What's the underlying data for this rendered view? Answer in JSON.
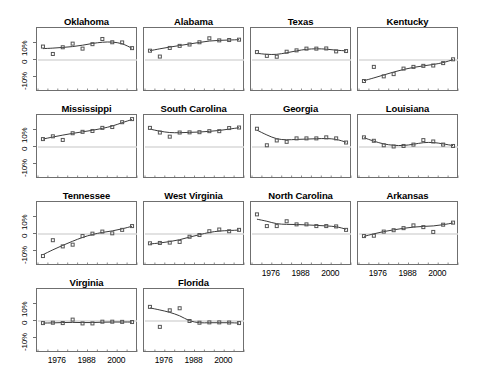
{
  "figure": {
    "type": "small-multiples-scatter-with-smooth",
    "background": "#ffffff",
    "axis_color": "#6f6f6f",
    "zero_line_color": "#d9d9d9",
    "point_color": "#555555",
    "line_color": "#3a3a3a"
  },
  "axes": {
    "y_ticks": [
      "10%",
      "0",
      "-10%"
    ],
    "y_values": [
      10,
      0,
      -10
    ],
    "y_range": [
      -18,
      18
    ],
    "x_ticks": [
      "1976",
      "1988",
      "2000"
    ],
    "x_tick_values": [
      1976,
      1988,
      2000
    ],
    "x_range": [
      1968,
      2008
    ],
    "n_minor_ticks": 11
  },
  "chart_data": {
    "type": "line",
    "title": "",
    "xlabel": "",
    "ylabel": "",
    "ylim": [
      -18,
      18
    ],
    "xlim": [
      1968,
      2008
    ],
    "panels": [
      {
        "name": "Oklahoma",
        "row": 0,
        "col": 0,
        "x": [
          1970,
          1974,
          1978,
          1982,
          1986,
          1990,
          1994,
          1998,
          2002,
          2006
        ],
        "points": [
          7.8,
          3.5,
          7.4,
          9.5,
          6.6,
          9.2,
          12.2,
          10.3,
          10.2,
          6.9
        ],
        "smooth": [
          6.6,
          6.9,
          7.3,
          7.8,
          8.6,
          9.6,
          10.3,
          10.4,
          9.4,
          6.8
        ]
      },
      {
        "name": "Alabama",
        "row": 0,
        "col": 1,
        "x": [
          1970,
          1974,
          1978,
          1982,
          1986,
          1990,
          1994,
          1998,
          2002,
          2006
        ],
        "points": [
          5.4,
          2.0,
          7.0,
          8.2,
          9.0,
          10.3,
          12.6,
          11.4,
          11.6,
          11.8
        ],
        "smooth": [
          5.4,
          6.5,
          7.5,
          8.4,
          9.3,
          10.2,
          11.0,
          11.4,
          11.6,
          11.8
        ]
      },
      {
        "name": "Texas",
        "row": 0,
        "col": 2,
        "x": [
          1970,
          1974,
          1978,
          1982,
          1986,
          1990,
          1994,
          1998,
          2002,
          2006
        ],
        "points": [
          4.6,
          2.4,
          1.9,
          4.8,
          5.6,
          6.6,
          6.6,
          6.7,
          5.0,
          5.2
        ],
        "smooth": [
          3.9,
          3.3,
          3.3,
          4.2,
          5.3,
          6.2,
          6.5,
          6.3,
          5.7,
          5.3
        ]
      },
      {
        "name": "Kentucky",
        "row": 0,
        "col": 3,
        "x": [
          1970,
          1974,
          1978,
          1982,
          1986,
          1990,
          1994,
          1998,
          2002,
          2006
        ],
        "points": [
          -12.2,
          -4.0,
          -9.5,
          -8.2,
          -5.0,
          -4.0,
          -3.4,
          -3.2,
          -1.8,
          0.4
        ],
        "smooth": [
          -12.0,
          -10.4,
          -8.7,
          -7.0,
          -5.5,
          -4.3,
          -3.4,
          -2.6,
          -1.5,
          0.2
        ]
      },
      {
        "name": "Mississippi",
        "row": 1,
        "col": 0,
        "x": [
          1970,
          1974,
          1978,
          1982,
          1986,
          1990,
          1994,
          1998,
          2002,
          2006
        ],
        "points": [
          4.6,
          6.2,
          4.1,
          8.0,
          8.8,
          9.3,
          11.1,
          11.6,
          14.4,
          16.2
        ],
        "smooth": [
          4.6,
          5.8,
          6.9,
          7.9,
          8.8,
          9.7,
          10.8,
          12.2,
          14.1,
          16.0
        ]
      },
      {
        "name": "South Carolina",
        "row": 1,
        "col": 1,
        "x": [
          1970,
          1974,
          1978,
          1982,
          1986,
          1990,
          1994,
          1998,
          2002,
          2006
        ],
        "points": [
          11.1,
          8.4,
          6.0,
          8.4,
          8.5,
          8.6,
          9.2,
          9.2,
          11.0,
          11.3
        ],
        "smooth": [
          10.4,
          9.2,
          8.4,
          8.3,
          8.5,
          8.7,
          9.1,
          9.6,
          10.4,
          11.2
        ]
      },
      {
        "name": "Georgia",
        "row": 1,
        "col": 2,
        "x": [
          1970,
          1974,
          1978,
          1982,
          1986,
          1990,
          1994,
          1998,
          2002,
          2006
        ],
        "points": [
          10.6,
          1.0,
          3.8,
          3.0,
          5.0,
          5.0,
          5.0,
          5.6,
          5.0,
          2.6
        ],
        "smooth": [
          9.8,
          7.0,
          4.8,
          4.2,
          4.4,
          4.6,
          4.8,
          4.9,
          4.4,
          2.8
        ]
      },
      {
        "name": "Louisiana",
        "row": 1,
        "col": 3,
        "x": [
          1970,
          1974,
          1978,
          1982,
          1986,
          1990,
          1994,
          1998,
          2002,
          2006
        ],
        "points": [
          5.6,
          3.6,
          1.0,
          0.3,
          0.6,
          1.4,
          4.0,
          3.2,
          1.4,
          0.6
        ],
        "smooth": [
          5.4,
          3.4,
          1.8,
          1.0,
          0.9,
          1.6,
          2.5,
          2.6,
          1.8,
          0.8
        ]
      },
      {
        "name": "Tennessee",
        "row": 2,
        "col": 0,
        "x": [
          1970,
          1974,
          1978,
          1982,
          1986,
          1990,
          1994,
          1998,
          2002,
          2006
        ],
        "points": [
          -12.8,
          -3.6,
          -7.2,
          -6.2,
          -1.2,
          0.2,
          1.4,
          0.4,
          2.4,
          4.6
        ],
        "smooth": [
          -12.0,
          -9.2,
          -6.6,
          -4.2,
          -2.0,
          -0.3,
          0.9,
          1.8,
          3.0,
          4.5
        ]
      },
      {
        "name": "West Virginia",
        "row": 2,
        "col": 1,
        "x": [
          1970,
          1974,
          1978,
          1982,
          1986,
          1990,
          1994,
          1998,
          2002,
          2006
        ],
        "points": [
          -5.4,
          -5.2,
          -5.0,
          -4.6,
          -1.6,
          -0.6,
          1.6,
          2.6,
          1.6,
          2.4
        ],
        "smooth": [
          -5.8,
          -5.2,
          -4.4,
          -3.3,
          -1.8,
          -0.4,
          0.9,
          1.7,
          2.0,
          2.3
        ]
      },
      {
        "name": "North Carolina",
        "row": 2,
        "col": 2,
        "x": [
          1970,
          1974,
          1978,
          1982,
          1986,
          1990,
          1994,
          1998,
          2002,
          2006
        ],
        "points": [
          11.4,
          4.6,
          4.6,
          7.4,
          5.6,
          5.6,
          4.6,
          4.6,
          4.4,
          2.4
        ],
        "smooth": [
          8.6,
          7.4,
          6.0,
          5.6,
          5.5,
          5.3,
          5.0,
          4.7,
          4.2,
          2.8
        ]
      },
      {
        "name": "Arkansas",
        "row": 2,
        "col": 3,
        "x": [
          1970,
          1974,
          1978,
          1982,
          1986,
          1990,
          1994,
          1998,
          2002,
          2006
        ],
        "points": [
          -1.2,
          -1.0,
          1.4,
          2.2,
          3.4,
          5.0,
          4.0,
          1.2,
          5.4,
          6.6
        ],
        "smooth": [
          -1.4,
          0.1,
          1.4,
          2.4,
          3.3,
          4.0,
          4.4,
          4.7,
          5.4,
          6.4
        ]
      },
      {
        "name": "Virginia",
        "row": 3,
        "col": 0,
        "x": [
          1970,
          1974,
          1978,
          1982,
          1986,
          1990,
          1994,
          1998,
          2002,
          2006
        ],
        "points": [
          -1.2,
          -1.0,
          -1.2,
          0.8,
          -1.4,
          -1.4,
          -0.4,
          -0.4,
          -0.5,
          -0.6
        ],
        "smooth": [
          -1.2,
          -1.1,
          -0.9,
          -0.8,
          -0.9,
          -0.9,
          -0.7,
          -0.6,
          -0.6,
          -0.6
        ]
      },
      {
        "name": "Florida",
        "row": 3,
        "col": 1,
        "x": [
          1970,
          1974,
          1978,
          1982,
          1986,
          1990,
          1994,
          1998,
          2002,
          2006
        ],
        "points": [
          8.2,
          -3.4,
          6.2,
          7.4,
          0.0,
          -1.0,
          -0.8,
          -0.8,
          -0.9,
          -1.2
        ],
        "smooth": [
          7.6,
          6.4,
          5.0,
          3.0,
          0.2,
          -1.0,
          -1.0,
          -1.0,
          -1.0,
          -1.2
        ]
      }
    ]
  }
}
